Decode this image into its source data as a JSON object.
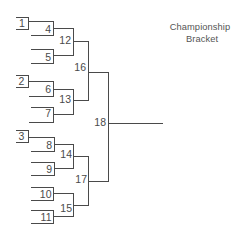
{
  "title": {
    "line1": "Championship",
    "line2": "Bracket"
  },
  "bracket": {
    "seeds": [
      {
        "label": "1"
      },
      {
        "label": "2"
      },
      {
        "label": "3"
      }
    ],
    "round1": [
      {
        "label": "4"
      },
      {
        "label": "5"
      },
      {
        "label": "6"
      },
      {
        "label": "7"
      },
      {
        "label": "8"
      },
      {
        "label": "9"
      },
      {
        "label": "10"
      },
      {
        "label": "11"
      }
    ],
    "round2": [
      {
        "label": "12"
      },
      {
        "label": "13"
      },
      {
        "label": "14"
      },
      {
        "label": "15"
      }
    ],
    "round3": [
      {
        "label": "16"
      },
      {
        "label": "17"
      }
    ],
    "final": {
      "label": "18"
    }
  },
  "colors": {
    "line": "#4a4a4a",
    "text": "#555555",
    "background": "#ffffff"
  }
}
